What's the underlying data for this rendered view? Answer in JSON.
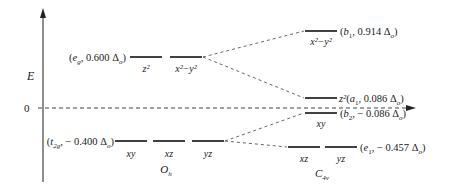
{
  "diagram": {
    "axis": {
      "ylabel": "E",
      "zero_label": "0"
    },
    "left_group": {
      "symmetry": "O",
      "symmetry_sub": "h",
      "upper": {
        "label_sym": "e",
        "label_sym_sub": "g",
        "label_value": "0.600 Δ",
        "label_value_sub": "o",
        "orbitals": [
          "z²",
          "x²−y²"
        ]
      },
      "lower": {
        "label_sym": "t",
        "label_sym_sub": "2g",
        "label_value": "− 0.400 Δ",
        "label_value_sub": "o",
        "orbitals": [
          "xy",
          "xz",
          "yz"
        ]
      }
    },
    "right_group": {
      "symmetry": "C",
      "symmetry_sub": "4v",
      "b1": {
        "sym": "b",
        "sym_sub": "1",
        "value": "0.914 Δ",
        "value_sub": "o",
        "orbital": "x²−y²"
      },
      "a1": {
        "orbital_prefix": "z²",
        "sym": "a",
        "sym_sub": "1",
        "value": "0.086 Δ",
        "value_sub": "o"
      },
      "b2": {
        "sym": "b",
        "sym_sub": "2",
        "value": "− 0.086 Δ",
        "value_sub": "o",
        "orbital": "xy"
      },
      "e1": {
        "sym": "e",
        "sym_sub": "1",
        "value": "− 0.457 Δ",
        "value_sub": "o",
        "orbitals": [
          "xz",
          "yz"
        ]
      }
    }
  }
}
